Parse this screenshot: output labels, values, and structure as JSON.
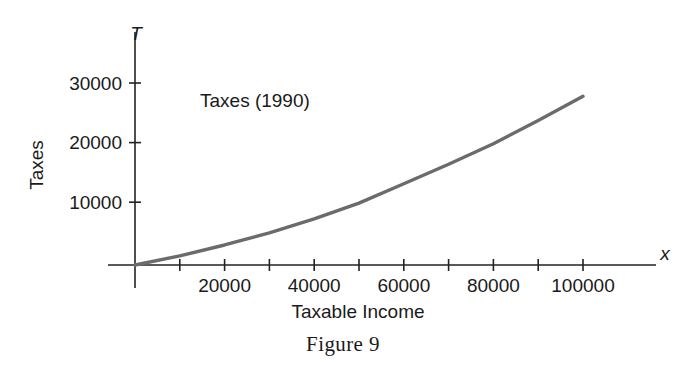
{
  "figure": {
    "caption": "Figure 9",
    "annotation": "Taxes (1990)",
    "x_axis_name": "x",
    "y_axis_name": "T",
    "x_axis_title": "Taxable Income",
    "y_axis_title": "Taxes",
    "curve_color": "#6b6b6b",
    "axis_color": "#222222"
  },
  "chart_data": {
    "type": "line",
    "title": "Taxes (1990)",
    "xlabel": "Taxable Income",
    "ylabel": "Taxes",
    "xlim": [
      0,
      116000
    ],
    "ylim": [
      0,
      34000
    ],
    "grid": false,
    "legend": false,
    "x_axis_symbol": "x",
    "y_axis_symbol": "T",
    "x_tick_values": [
      20000,
      40000,
      60000,
      80000,
      100000
    ],
    "x_tick_labels": [
      "20000",
      "40000",
      "60000",
      "80000",
      "100000"
    ],
    "x_minor_tick_values": [
      10000,
      30000,
      50000,
      70000,
      90000
    ],
    "y_tick_values": [
      10000,
      20000,
      30000
    ],
    "y_tick_labels": [
      "10000",
      "20000",
      "30000"
    ],
    "series": [
      {
        "name": "Taxes (1990)",
        "x": [
          0,
          10000,
          20000,
          30000,
          40000,
          50000,
          60000,
          70000,
          80000,
          90000,
          100000
        ],
        "values": [
          0,
          1500,
          3300,
          5300,
          7600,
          10200,
          13400,
          16600,
          20000,
          23800,
          27800
        ]
      }
    ]
  }
}
